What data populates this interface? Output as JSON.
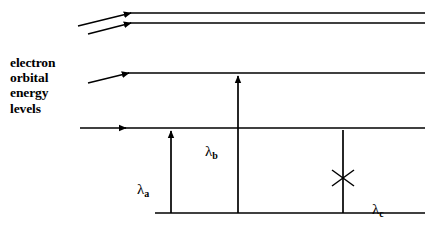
{
  "figure": {
    "title_label": "electron\norbital\nenergy\nlevels",
    "stroke_color": "#000000",
    "background_color": "#ffffff",
    "width": 433,
    "height": 226
  },
  "levels": [
    {
      "id": "level-1",
      "y": 13,
      "x_start": 130,
      "x_end": 425,
      "note": "highest orbital level"
    },
    {
      "id": "level-2",
      "y": 23,
      "x_start": 130,
      "x_end": 425,
      "note": "second orbital level"
    },
    {
      "id": "level-3",
      "y": 73,
      "x_start": 128,
      "x_end": 425,
      "note": "third orbital level"
    },
    {
      "id": "level-4",
      "y": 128,
      "x_start": 125,
      "x_end": 425,
      "note": "ground orbital level"
    },
    {
      "id": "baseline",
      "y": 213,
      "x_start": 155,
      "x_end": 425,
      "note": "baseline"
    }
  ],
  "incoming_arrows": [
    {
      "id": "incoming-arrow-1",
      "x1": 78,
      "y1": 26,
      "x2": 131,
      "y2": 13
    },
    {
      "id": "incoming-arrow-2",
      "x1": 88,
      "y1": 34,
      "x2": 131,
      "y2": 23
    },
    {
      "id": "incoming-arrow-3",
      "x1": 88,
      "y1": 83,
      "x2": 129,
      "y2": 73
    },
    {
      "id": "incoming-arrow-4",
      "x1": 80,
      "y1": 128,
      "x2": 126,
      "y2": 128
    }
  ],
  "transitions": [
    {
      "id": "transition-a",
      "label": "λ",
      "subscript": "a",
      "x": 171,
      "y_bottom": 213,
      "y_top": 130,
      "blocked": false,
      "label_x": 137,
      "label_y": 181
    },
    {
      "id": "transition-b",
      "label": "λ",
      "subscript": "b",
      "x": 238,
      "y_bottom": 213,
      "y_top": 75,
      "blocked": false,
      "label_x": 205,
      "label_y": 143
    },
    {
      "id": "transition-c",
      "label": "λ",
      "subscript": "c",
      "x": 343,
      "y_bottom": 213,
      "y_top": 130,
      "blocked": true,
      "cross_center_x": 343,
      "cross_center_y": 178,
      "cross_size": 11,
      "label_x": 372,
      "label_y": 201
    }
  ]
}
